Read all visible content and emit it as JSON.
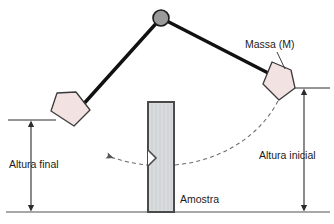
{
  "figure": {
    "background_color": "#ffffff"
  },
  "labels": {
    "mass": "Massa (M)",
    "initial_height": "Altura inicial",
    "final_height": "Altura final",
    "specimen": "Amostra"
  },
  "colors": {
    "pivot_fill": "#9a9a9a",
    "pivot_stroke": "#1b1b1b",
    "arm_stroke": "#111111",
    "hammer_fill": "#f3e2e2",
    "hammer_stroke": "#3a3a3a",
    "specimen_fill": "#d9dcdd",
    "specimen_stroke": "#4a4a4a",
    "baseline": "#8b8b8b",
    "dimension_line": "#2b2b2b",
    "trajectory": "#6e6e6e",
    "text": "#1b1b1b"
  },
  "geometry": {
    "pivot": {
      "cx": 161,
      "cy": 18,
      "r": 8
    },
    "baseline_y": 212,
    "initial_height_top_y": 88,
    "final_height_top_y": 120,
    "initial_arrow_x": 304,
    "final_arrow_x": 31,
    "specimen": {
      "x": 148,
      "y": 102,
      "width": 26,
      "height": 110
    },
    "notch_y": 158
  }
}
